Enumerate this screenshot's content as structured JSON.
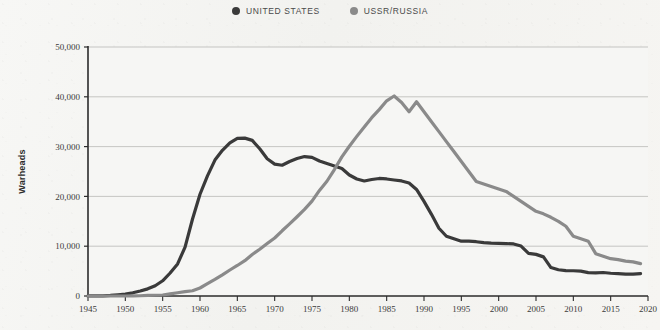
{
  "legend": {
    "position": "top-center",
    "entries": [
      {
        "label": "UNITED STATES",
        "color": "#3a3a3a",
        "icon": "dot-icon"
      },
      {
        "label": "USSR/RUSSIA",
        "color": "#8a8a8a",
        "icon": "dot-icon"
      }
    ]
  },
  "axes": {
    "ylabel": "Warheads",
    "xlabel": "",
    "ytick_labels": [
      "0",
      "10,000",
      "20,000",
      "30,000",
      "40,000",
      "50,000"
    ],
    "xtick_labels": [
      "1945",
      "1950",
      "1955",
      "1960",
      "1965",
      "1970",
      "1975",
      "1980",
      "1985",
      "1990",
      "1995",
      "2000",
      "2005",
      "2010",
      "2015",
      "2020"
    ]
  },
  "colors": {
    "background": "#f4f4f2",
    "plot_background": "#f6f6f4",
    "gridline": "#b9b9b6",
    "axis": "#2b2b2b",
    "united_states": "#3a3a3a",
    "ussr_russia": "#8a8a8a",
    "text": "#3b3b3b"
  },
  "chart_data": {
    "type": "line",
    "title": "",
    "subtitle": "",
    "xlabel": "",
    "ylabel": "Warheads",
    "xlim": [
      1945,
      2020
    ],
    "ylim": [
      0,
      50000
    ],
    "yticks": [
      0,
      10000,
      20000,
      30000,
      40000,
      50000
    ],
    "xticks": [
      1945,
      1950,
      1955,
      1960,
      1965,
      1970,
      1975,
      1980,
      1985,
      1990,
      1995,
      2000,
      2005,
      2010,
      2015,
      2020
    ],
    "grid": "horizontal",
    "legend_position": "top-center",
    "series": [
      {
        "name": "UNITED STATES",
        "color": "#3a3a3a",
        "x": [
          1945,
          1946,
          1947,
          1948,
          1949,
          1950,
          1951,
          1952,
          1953,
          1954,
          1955,
          1956,
          1957,
          1958,
          1959,
          1960,
          1961,
          1962,
          1963,
          1964,
          1965,
          1966,
          1967,
          1968,
          1969,
          1970,
          1971,
          1972,
          1973,
          1974,
          1975,
          1976,
          1977,
          1978,
          1979,
          1980,
          1981,
          1982,
          1983,
          1984,
          1985,
          1986,
          1987,
          1988,
          1989,
          1990,
          1991,
          1992,
          1993,
          1994,
          1995,
          1996,
          1997,
          1998,
          1999,
          2000,
          2001,
          2002,
          2003,
          2004,
          2005,
          2006,
          2007,
          2008,
          2009,
          2010,
          2011,
          2012,
          2013,
          2014,
          2015,
          2016,
          2017,
          2018,
          2019
        ],
        "values": [
          6,
          11,
          32,
          110,
          235,
          369,
          640,
          1005,
          1436,
          2063,
          3057,
          4618,
          6444,
          9822,
          15468,
          20434,
          24111,
          27297,
          29249,
          30751,
          31642,
          31700,
          31255,
          29561,
          27552,
          26490,
          26254,
          27000,
          27600,
          28000,
          27826,
          27100,
          26600,
          26100,
          25600,
          24300,
          23500,
          23100,
          23400,
          23600,
          23500,
          23300,
          23100,
          22700,
          21392,
          19008,
          16400,
          13600,
          12000,
          11500,
          11000,
          11000,
          10900,
          10700,
          10600,
          10577,
          10526,
          10457,
          10027,
          8570,
          8360,
          7853,
          5709,
          5273,
          5113,
          5066,
          5000,
          4700,
          4650,
          4717,
          4571,
          4500,
          4400,
          4400,
          4500
        ]
      },
      {
        "name": "USSR/RUSSIA",
        "color": "#8a8a8a",
        "x": [
          1945,
          1946,
          1947,
          1948,
          1949,
          1950,
          1951,
          1952,
          1953,
          1954,
          1955,
          1956,
          1957,
          1958,
          1959,
          1960,
          1961,
          1962,
          1963,
          1964,
          1965,
          1966,
          1967,
          1968,
          1969,
          1970,
          1971,
          1972,
          1973,
          1974,
          1975,
          1976,
          1977,
          1978,
          1979,
          1980,
          1981,
          1982,
          1983,
          1984,
          1985,
          1986,
          1987,
          1988,
          1989,
          1990,
          1991,
          1992,
          1993,
          1994,
          1995,
          1996,
          1997,
          1998,
          1999,
          2000,
          2001,
          2002,
          2003,
          2004,
          2005,
          2006,
          2007,
          2008,
          2009,
          2010,
          2011,
          2012,
          2013,
          2014,
          2015,
          2016,
          2017,
          2018,
          2019
        ],
        "values": [
          0,
          0,
          0,
          0,
          1,
          5,
          25,
          50,
          120,
          150,
          200,
          426,
          660,
          869,
          1060,
          1605,
          2471,
          3322,
          4238,
          5221,
          6129,
          7089,
          8339,
          9399,
          10538,
          11643,
          13092,
          14478,
          15915,
          17385,
          19055,
          21205,
          23044,
          25393,
          27935,
          30062,
          32049,
          33952,
          35804,
          37431,
          39197,
          40159,
          38859,
          37000,
          39000,
          37000,
          35000,
          33000,
          31000,
          29000,
          27000,
          25000,
          23000,
          22500,
          22000,
          21500,
          21000,
          20000,
          19000,
          18000,
          17000,
          16500,
          15800,
          15000,
          14000,
          12000,
          11500,
          11000,
          8500,
          8000,
          7500,
          7300,
          7000,
          6850,
          6500
        ]
      }
    ]
  }
}
